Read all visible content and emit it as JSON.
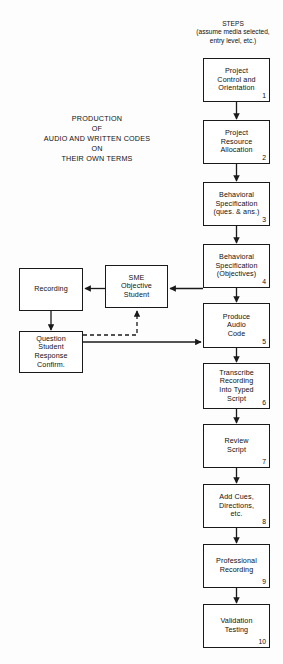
{
  "diagram": {
    "steps_heading": "STEPS\n(assume media selected,\nentry level, etc.)",
    "production_title": "PRODUCTION\nOF\nAUDIO AND WRITTEN CODES\nON\nTHEIR OWN TERMS",
    "colors": {
      "background": "#fdfdfd",
      "stroke": "#1a1a1a",
      "node_fill": "#ffffff",
      "text": "#111111"
    },
    "main_flow": [
      {
        "id": "step-1",
        "label": "Project\nControl and\nOrientation",
        "number": "1",
        "x": 203,
        "y": 58,
        "w": 67,
        "h": 44
      },
      {
        "id": "step-2",
        "label": "Project\nResource\nAllocation",
        "number": "2",
        "x": 203,
        "y": 120,
        "w": 67,
        "h": 44
      },
      {
        "id": "step-3",
        "label": "Behavioral\nSpecification\n(ques. & ans.)",
        "number": "3",
        "x": 203,
        "y": 182,
        "w": 67,
        "h": 44
      },
      {
        "id": "step-4",
        "label": "Behavioral\nSpecification\n(Objectives)",
        "number": "4",
        "x": 203,
        "y": 244,
        "w": 67,
        "h": 44
      },
      {
        "id": "step-5",
        "label": "Produce\nAudio\nCode",
        "number": "5",
        "x": 203,
        "y": 303,
        "w": 67,
        "h": 45
      },
      {
        "id": "step-6",
        "label": "Transcribe\nRecording\nInto Typed\nScript",
        "number": "6",
        "x": 203,
        "y": 363,
        "w": 67,
        "h": 46
      },
      {
        "id": "step-7",
        "label": "Review\nScript",
        "number": "7",
        "x": 203,
        "y": 424,
        "w": 67,
        "h": 44
      },
      {
        "id": "step-8",
        "label": "Add Cues,\nDirections,\netc.",
        "number": "8",
        "x": 203,
        "y": 484,
        "w": 67,
        "h": 44
      },
      {
        "id": "step-9",
        "label": "Professional\nRecording",
        "number": "9",
        "x": 203,
        "y": 544,
        "w": 67,
        "h": 44
      },
      {
        "id": "step-10",
        "label": "Validation\nTesting",
        "number": "10",
        "x": 203,
        "y": 604,
        "w": 67,
        "h": 44
      }
    ],
    "side_nodes": [
      {
        "id": "recording",
        "label": "Recording",
        "x": 19,
        "y": 268,
        "w": 64,
        "h": 43
      },
      {
        "id": "sme",
        "label": "SME\nObjective\nStudent",
        "x": 105,
        "y": 265,
        "w": 63,
        "h": 43
      },
      {
        "id": "question-student",
        "label": "Question\nStudent\nResponse\nConfirm.",
        "x": 19,
        "y": 331,
        "w": 64,
        "h": 42
      }
    ],
    "connectors": [
      {
        "id": "conn-1-2",
        "from": "step-1",
        "to": "step-2",
        "style": "solid"
      },
      {
        "id": "conn-2-3",
        "from": "step-2",
        "to": "step-3",
        "style": "solid"
      },
      {
        "id": "conn-3-4",
        "from": "step-3",
        "to": "step-4",
        "style": "solid"
      },
      {
        "id": "conn-4-5",
        "from": "step-4",
        "to": "step-5",
        "style": "solid"
      },
      {
        "id": "conn-5-6",
        "from": "step-5",
        "to": "step-6",
        "style": "solid"
      },
      {
        "id": "conn-6-7",
        "from": "step-6",
        "to": "step-7",
        "style": "solid"
      },
      {
        "id": "conn-7-8",
        "from": "step-7",
        "to": "step-8",
        "style": "solid"
      },
      {
        "id": "conn-8-9",
        "from": "step-8",
        "to": "step-9",
        "style": "solid"
      },
      {
        "id": "conn-9-10",
        "from": "step-9",
        "to": "step-10",
        "style": "solid"
      },
      {
        "id": "conn-step5-sme",
        "from": "step-5",
        "to": "sme",
        "style": "solid"
      },
      {
        "id": "conn-sme-recording",
        "from": "sme",
        "to": "recording",
        "style": "solid"
      },
      {
        "id": "conn-recording-question",
        "from": "recording",
        "to": "question-student",
        "style": "solid"
      },
      {
        "id": "conn-question-step5",
        "from": "question-student",
        "to": "step-5",
        "style": "solid"
      },
      {
        "id": "conn-question-sme",
        "from": "question-student",
        "to": "sme",
        "style": "dashed"
      }
    ]
  }
}
